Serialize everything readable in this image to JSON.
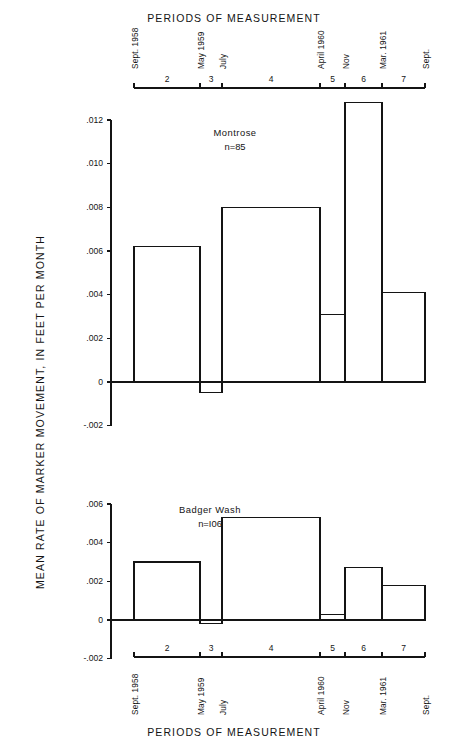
{
  "figure": {
    "title_top": "PERIODS OF MEASUREMENT",
    "title_bottom": "PERIODS OF MEASUREMENT",
    "y_axis_label": "MEAN RATE OF MARKER MOVEMENT, IN FEET PER MONTH"
  },
  "period_axis": {
    "segment_numbers": [
      "2",
      "3",
      "4",
      "5",
      "6",
      "7"
    ],
    "date_ticks": [
      "Sept. 1958",
      "May 1959",
      "July",
      "April 1960",
      "Nov",
      "Mar. 1961",
      "Sept."
    ]
  },
  "panels": [
    {
      "name": "Montrose",
      "count_label": "n=85",
      "y_ticks": [
        ".012",
        ".010",
        ".008",
        ".006",
        ".004",
        ".002",
        "0",
        "-.002"
      ]
    },
    {
      "name": "Badger Wash",
      "count_label": "n=I06",
      "y_ticks": [
        ".006",
        ".004",
        ".002",
        "0",
        "-.002"
      ]
    }
  ],
  "chart_data": [
    {
      "type": "bar",
      "title": "Montrose",
      "subtitle": "n=85",
      "xlabel": "PERIODS OF MEASUREMENT",
      "ylabel": "MEAN RATE OF MARKER MOVEMENT, IN FEET PER MONTH",
      "ylim": [
        -0.002,
        0.012
      ],
      "yticks": [
        -0.002,
        0,
        0.002,
        0.004,
        0.006,
        0.008,
        0.01,
        0.012
      ],
      "grid": false,
      "legend": "none",
      "categories": [
        "Sept. 1958 - May 1959",
        "May 1959 - July 1959",
        "July 1959 - April 1960",
        "April 1960 - Nov 1960",
        "Nov 1960 - Mar. 1961",
        "Mar. 1961 - Sept. 1961"
      ],
      "period_numbers": [
        2,
        3,
        4,
        5,
        6,
        7
      ],
      "values": [
        0.0062,
        -0.0005,
        0.008,
        0.0031,
        0.0128,
        0.0041
      ]
    },
    {
      "type": "bar",
      "title": "Badger Wash",
      "subtitle": "n=I06",
      "xlabel": "PERIODS OF MEASUREMENT",
      "ylabel": "MEAN RATE OF MARKER MOVEMENT, IN FEET PER MONTH",
      "ylim": [
        -0.002,
        0.006
      ],
      "yticks": [
        -0.002,
        0,
        0.002,
        0.004,
        0.006
      ],
      "grid": false,
      "legend": "none",
      "categories": [
        "Sept. 1958 - May 1959",
        "May 1959 - July 1959",
        "July 1959 - April 1960",
        "April 1960 - Nov 1960",
        "Nov 1960 - Mar. 1961",
        "Mar. 1961 - Sept. 1961"
      ],
      "period_numbers": [
        2,
        3,
        4,
        5,
        6,
        7
      ],
      "values": [
        0.003,
        -0.0002,
        0.0053,
        0.0003,
        0.0027,
        0.0018
      ]
    }
  ],
  "colors": {
    "ink": "#141414",
    "background": "#ffffff"
  }
}
